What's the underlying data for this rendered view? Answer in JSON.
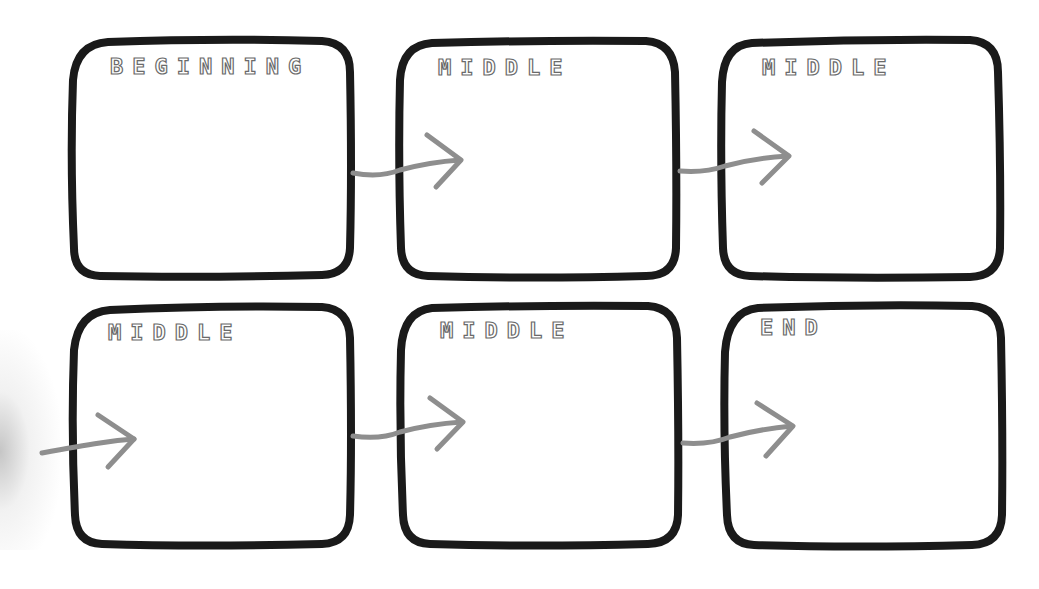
{
  "worksheet": {
    "title": "Story sequence boxes",
    "panels": [
      {
        "label": "BEGINNING",
        "row": 1,
        "col": 1
      },
      {
        "label": "MIDDLE",
        "row": 1,
        "col": 2
      },
      {
        "label": "MIDDLE",
        "row": 1,
        "col": 3
      },
      {
        "label": "MIDDLE",
        "row": 2,
        "col": 1
      },
      {
        "label": "MIDDLE",
        "row": 2,
        "col": 2
      },
      {
        "label": "END",
        "row": 2,
        "col": 3
      }
    ],
    "arrows": [
      {
        "from": "panel-1",
        "to": "panel-2"
      },
      {
        "from": "panel-2",
        "to": "panel-3"
      },
      {
        "from": "edge",
        "to": "panel-4"
      },
      {
        "from": "panel-4",
        "to": "panel-5"
      },
      {
        "from": "panel-5",
        "to": "panel-6"
      }
    ],
    "colors": {
      "box_stroke": "#1a1a1a",
      "arrow": "#8e8e8e",
      "label_outline": "#6a6a6a",
      "background": "#ffffff"
    }
  }
}
